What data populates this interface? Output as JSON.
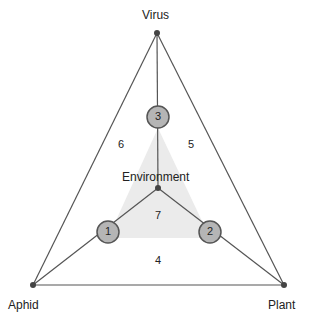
{
  "vertices": {
    "virus": "Virus",
    "aphid": "Aphid",
    "plant": "Plant"
  },
  "center_label": "Environment",
  "nodes": [
    {
      "id": "1",
      "label": "1"
    },
    {
      "id": "2",
      "label": "2"
    },
    {
      "id": "3",
      "label": "3"
    }
  ],
  "regions": {
    "r4": "4",
    "r5": "5",
    "r6": "6",
    "r7": "7"
  },
  "colors": {
    "line": "#555555",
    "node_fill": "#b5b5b5",
    "node_stroke": "#555555",
    "shade": "#e8e8e8"
  }
}
